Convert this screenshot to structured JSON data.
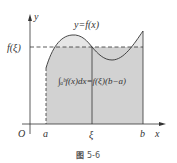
{
  "figure": {
    "curve_label": "y=f(x)",
    "y_axis_label": "y",
    "x_axis_label": "x",
    "origin_label": "O",
    "f_xi_label": "f(ξ)",
    "a_label": "a",
    "xi_label": "ξ",
    "b_label": "b",
    "formula": "∫ₐᵇf(x)dx=f(ξ)(b−a)",
    "caption_prefix": "图",
    "caption_number": "5-6"
  },
  "colors": {
    "shade": "#d4d4d4",
    "lightshade": "#e6e6e6",
    "line": "#333333"
  }
}
